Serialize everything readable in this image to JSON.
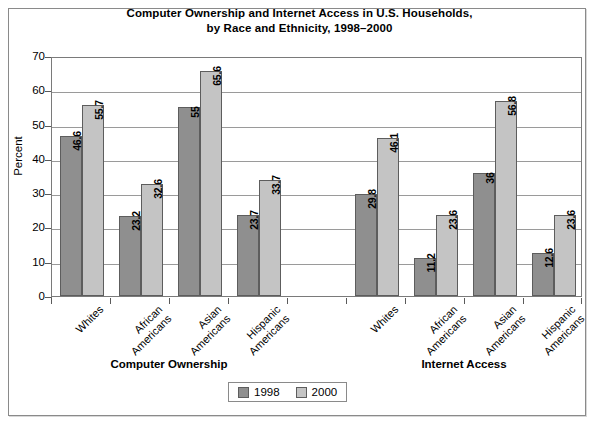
{
  "chart_data": {
    "type": "bar",
    "title": "Computer Ownership and Internet Access in U.S. Households, by Race and Ethnicity, 1998–2000",
    "title_lines": [
      "Computer Ownership and Internet Access in U.S. Households,",
      "by Race and Ethnicity, 1998–2000"
    ],
    "xlabel": "",
    "ylabel": "Percent",
    "ylim": [
      0,
      70
    ],
    "yticks": [
      0,
      10,
      20,
      30,
      40,
      50,
      60,
      70
    ],
    "ytick_labels": [
      "0",
      "10",
      "20",
      "30",
      "40",
      "50",
      "60",
      "70"
    ],
    "grid": true,
    "legend_position": "bottom-center",
    "legend_entries": [
      "1998",
      "2000"
    ],
    "colors": {
      "series_1998": "#8f8f8f",
      "series_2000": "#c4c4c4",
      "gridline": "#9a9a9a",
      "frame": "#8a8a8a",
      "text": "#000000"
    },
    "group_labels": [
      "Computer Ownership",
      "Internet Access"
    ],
    "categories": [
      "Whites",
      "African Americans",
      "Asian Americans",
      "Hispanic Americans",
      "",
      "Whites",
      "African Americans",
      "Asian Americans",
      "Hispanic Americans"
    ],
    "category_lines": [
      [
        "Whites"
      ],
      [
        "African",
        "Americans"
      ],
      [
        "Asian",
        "Americans"
      ],
      [
        "Hispanic",
        "Americans"
      ],
      [
        ""
      ],
      [
        "Whites"
      ],
      [
        "African",
        "Americans"
      ],
      [
        "Asian",
        "Americans"
      ],
      [
        "Hispanic",
        "Americans"
      ]
    ],
    "series": [
      {
        "name": "1998",
        "values": [
          46.6,
          23.2,
          55,
          23.7,
          null,
          29.8,
          11.2,
          36,
          12.6
        ],
        "value_labels": [
          "46.6",
          "23.2",
          "55",
          "23.7",
          "",
          "29.8",
          "11.2",
          "36",
          "12.6"
        ]
      },
      {
        "name": "2000",
        "values": [
          55.7,
          32.6,
          65.6,
          33.7,
          null,
          46.1,
          23.6,
          56.8,
          23.6
        ],
        "value_labels": [
          "55.7",
          "32.6",
          "65.6",
          "33.7",
          "",
          "46.1",
          "23.6",
          "56.8",
          "23.6"
        ]
      }
    ],
    "groups": [
      {
        "label": "Computer Ownership",
        "categories": [
          "Whites",
          "African Americans",
          "Asian Americans",
          "Hispanic Americans"
        ],
        "1998": [
          46.6,
          23.2,
          55,
          23.7
        ],
        "2000": [
          55.7,
          32.6,
          65.6,
          33.7
        ]
      },
      {
        "label": "Internet Access",
        "categories": [
          "Whites",
          "African Americans",
          "Asian Americans",
          "Hispanic Americans"
        ],
        "1998": [
          29.8,
          11.2,
          36,
          12.6
        ],
        "2000": [
          46.1,
          23.6,
          56.8,
          23.6
        ]
      }
    ]
  }
}
